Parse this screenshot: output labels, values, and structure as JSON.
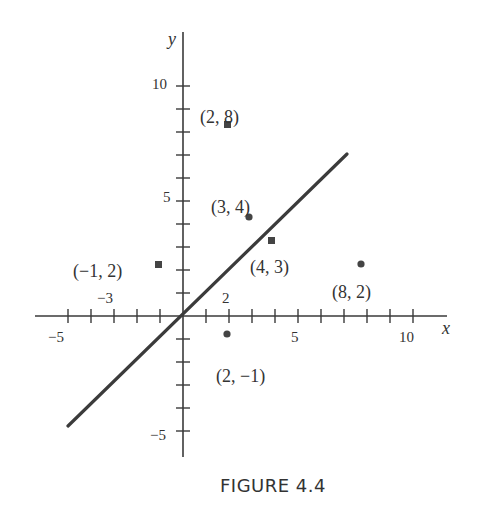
{
  "chart_data": {
    "type": "scatter",
    "title": "",
    "caption": "FIGURE 4.4",
    "xlabel": "x",
    "ylabel": "y",
    "xlim": [
      -5.3,
      11.5
    ],
    "ylim": [
      -6,
      12
    ],
    "grid": false,
    "x_tick_labels": [
      {
        "value": -5,
        "label": "−5"
      },
      {
        "value": -3,
        "label": "−3"
      },
      {
        "value": 2,
        "label": "2"
      },
      {
        "value": 5,
        "label": "5"
      },
      {
        "value": 10,
        "label": "10"
      }
    ],
    "y_tick_labels": [
      {
        "value": 10,
        "label": "10"
      },
      {
        "value": 5,
        "label": "5"
      },
      {
        "value": -5,
        "label": "−5"
      }
    ],
    "x_ticks": [
      -5,
      -4,
      -3,
      -2,
      -1,
      1,
      2,
      3,
      4,
      5,
      6,
      7,
      8,
      9,
      10
    ],
    "y_ticks": [
      -5,
      -4,
      -3,
      -2,
      -1,
      1,
      2,
      3,
      4,
      5,
      6,
      7,
      8,
      9,
      10
    ],
    "line": {
      "description": "line y = x",
      "from": [
        -5,
        -4.8
      ],
      "to": [
        7.1,
        7.1
      ],
      "color": "#3b3b3b"
    },
    "points": [
      {
        "x": 2,
        "y": 8,
        "marker": "square",
        "label": "(2, 8)"
      },
      {
        "x": 3,
        "y": 4,
        "marker": "circle",
        "label": "(3, 4)"
      },
      {
        "x": 4,
        "y": 3,
        "marker": "square",
        "label": "(4, 3)"
      },
      {
        "x": -1,
        "y": 2,
        "marker": "square",
        "label": "(−1, 2)"
      },
      {
        "x": 8,
        "y": 2,
        "marker": "circle",
        "label": "(8, 2)"
      },
      {
        "x": 2,
        "y": -1,
        "marker": "circle",
        "label": "(2, −1)"
      }
    ]
  },
  "labels": {
    "caption": "FIGURE 4.4",
    "x_axis": "x",
    "y_axis": "y",
    "p_2_8": "(2, 8)",
    "p_3_4": "(3, 4)",
    "p_4_3": "(4, 3)",
    "p_m1_2": "(−1, 2)",
    "p_8_2": "(8, 2)",
    "p_2_m1": "(2, −1)",
    "xt_m5": "−5",
    "xt_m3": "−3",
    "xt_2": "2",
    "xt_5": "5",
    "xt_10": "10",
    "yt_10": "10",
    "yt_5": "5",
    "yt_m5": "−5"
  }
}
